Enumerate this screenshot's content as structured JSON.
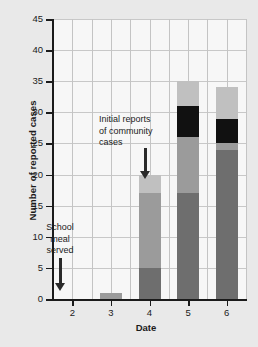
{
  "chart_data": {
    "type": "bar",
    "subtype": "stacked-bar",
    "title": "",
    "xlabel": "Date",
    "ylabel": "Number of reported cases",
    "categories": [
      "2",
      "3",
      "4",
      "5",
      "6"
    ],
    "ylim": [
      0,
      45
    ],
    "ytick_labels": [
      "0",
      "5",
      "10",
      "15",
      "20",
      "25",
      "30",
      "35",
      "40",
      "45"
    ],
    "ytick_values": [
      0,
      5,
      10,
      15,
      20,
      25,
      30,
      35,
      40,
      45
    ],
    "grid": "both",
    "legend": "none",
    "series": [
      {
        "name": "dark-gray",
        "color": "#6e6e6e",
        "values": [
          0,
          0,
          5,
          17,
          24
        ]
      },
      {
        "name": "mid-gray",
        "color": "#9b9b9b",
        "values": [
          0,
          1,
          12,
          9,
          1
        ]
      },
      {
        "name": "black",
        "color": "#111111",
        "values": [
          0,
          0,
          0,
          5,
          4
        ]
      },
      {
        "name": "light-gray",
        "color": "#c0c0c0",
        "values": [
          0,
          0,
          3,
          4,
          5
        ]
      }
    ],
    "totals": [
      0,
      1,
      20,
      35,
      34
    ],
    "annotations": [
      {
        "id": "school-meal",
        "text": "School\nmeal\nserved",
        "points_to": "2",
        "marker": "down-arrow"
      },
      {
        "id": "community-cases",
        "text": "Initial reports\nof community\ncases",
        "points_to": "4",
        "marker": "down-arrow"
      }
    ]
  },
  "axes": {
    "x_title": "Date",
    "y_title": "Number of reported cases"
  }
}
